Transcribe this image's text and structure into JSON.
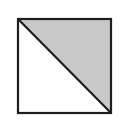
{
  "figure": {
    "square": {
      "x": 18,
      "y": 19,
      "width": 93,
      "height": 94
    },
    "shaded_region": "upper-right-triangle",
    "colors": {
      "stroke": "#1e1e1e",
      "shade": "#c8c8c8",
      "background": "#ffffff"
    }
  }
}
